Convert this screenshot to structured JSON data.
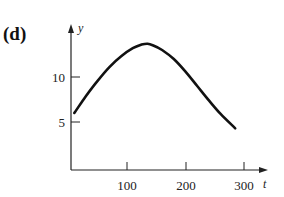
{
  "panel_label": "(d)",
  "chart_data": {
    "type": "line",
    "title": "",
    "xlabel": "t",
    "ylabel": "y",
    "x_ticks": [
      100,
      200,
      300
    ],
    "y_ticks": [
      5,
      10
    ],
    "xlim": [
      0,
      310
    ],
    "ylim": [
      0,
      15
    ],
    "grid": false,
    "legend": null,
    "series": [
      {
        "name": "y(t)",
        "x": [
          10,
          30,
          50,
          70,
          90,
          110,
          125,
          135,
          145,
          160,
          180,
          200,
          220,
          240,
          260,
          285
        ],
        "y": [
          6.0,
          7.9,
          9.6,
          11.1,
          12.3,
          13.2,
          13.6,
          13.7,
          13.5,
          13.0,
          12.0,
          10.6,
          9.0,
          7.4,
          5.9,
          4.3
        ]
      }
    ]
  },
  "axes": {
    "x_tick_labels": [
      "100",
      "200",
      "300"
    ],
    "y_tick_labels": [
      "5",
      "10"
    ],
    "x_name": "t",
    "y_name": "y"
  }
}
